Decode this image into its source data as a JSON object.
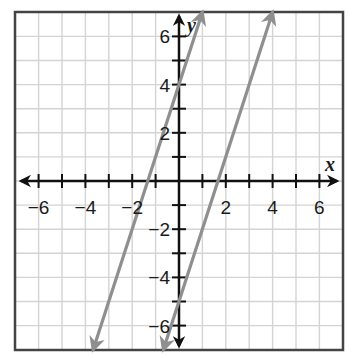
{
  "chart_data": {
    "type": "line",
    "title": "",
    "xlabel": "x",
    "ylabel": "y",
    "xlim": [
      -7,
      7
    ],
    "ylim": [
      -7,
      7
    ],
    "grid": true,
    "x_ticks": [
      -6,
      -4,
      -2,
      2,
      4,
      6
    ],
    "y_ticks": [
      -6,
      -4,
      -2,
      2,
      4,
      6
    ],
    "x_tick_labels": [
      "−6",
      "−4",
      "−2",
      "2",
      "4",
      "6"
    ],
    "y_tick_labels": [
      "−6",
      "−4",
      "−2",
      "2",
      "4",
      "6"
    ],
    "series": [
      {
        "name": "line-1",
        "equation": "y = 3x + 4",
        "slope": 3,
        "intercept": 4,
        "points": [
          [
            -3.67,
            -7
          ],
          [
            1,
            7
          ]
        ],
        "arrows": "both"
      },
      {
        "name": "line-2",
        "equation": "y = 3x - 5",
        "slope": 3,
        "intercept": -5,
        "points": [
          [
            -0.67,
            -7
          ],
          [
            4,
            7
          ]
        ],
        "arrows": "both"
      }
    ],
    "colors": {
      "grid": "#d4d4d4",
      "axes": "#111111",
      "frame": "#444444",
      "lines": "#8f8f8f"
    }
  }
}
